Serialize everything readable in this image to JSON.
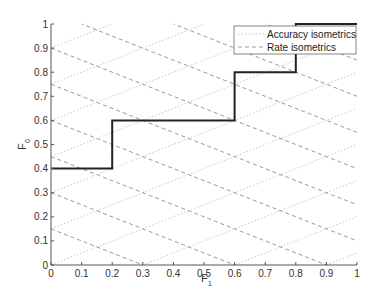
{
  "chart_data": {
    "type": "line",
    "title": "",
    "xlabel": "F",
    "xlabel_subscript": "1",
    "ylabel": "F",
    "ylabel_subscript": "0",
    "xlim": [
      0,
      1
    ],
    "ylim": [
      0,
      1
    ],
    "grid": false,
    "legend_position": "top-right",
    "x_ticks": [
      "0",
      "0.1",
      "0.2",
      "0.3",
      "0.4",
      "0.5",
      "0.6",
      "0.7",
      "0.8",
      "0.9",
      "1"
    ],
    "y_ticks": [
      "0",
      "0.1",
      "0.2",
      "0.3",
      "0.4",
      "0.5",
      "0.6",
      "0.7",
      "0.8",
      "0.9",
      "1"
    ],
    "series": [
      {
        "name": "Step curve",
        "style": "solid-black",
        "x": [
          0,
          0.2,
          0.2,
          0.6,
          0.6,
          0.8,
          0.8,
          1.0
        ],
        "y": [
          0.4,
          0.4,
          0.6,
          0.6,
          0.8,
          0.8,
          1.0,
          1.0
        ]
      },
      {
        "name": "Accuracy isometrics",
        "style": "dotted-light",
        "slope": 0.5,
        "intercepts": [
          -0.45,
          -0.3,
          -0.15,
          0.0,
          0.15,
          0.3,
          0.45,
          0.6,
          0.75,
          0.9
        ]
      },
      {
        "name": "Rate isometrics",
        "style": "dashed-gray",
        "slope": -0.5,
        "intercepts": [
          0.15,
          0.3,
          0.45,
          0.6,
          0.75,
          0.9,
          1.05,
          1.2,
          1.35,
          1.5
        ]
      }
    ]
  },
  "legend": {
    "items": [
      {
        "label": "Accuracy isometrics",
        "style": "dotted"
      },
      {
        "label": "Rate isometrics",
        "style": "dashed"
      }
    ]
  },
  "colors": {
    "curve": "#222222",
    "axis": "#555555",
    "accuracy": "#c8c8c8",
    "rate": "#9a9a9a"
  }
}
